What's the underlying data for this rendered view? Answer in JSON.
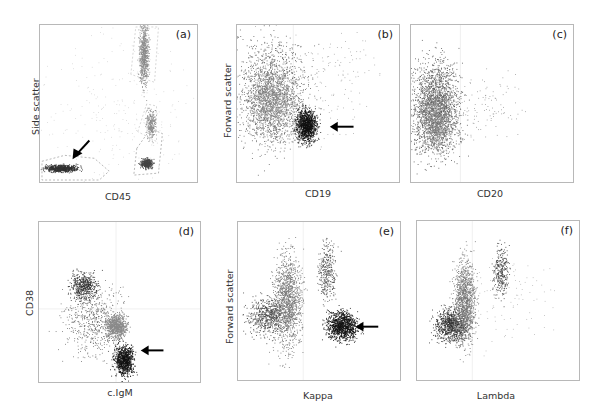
{
  "figure": {
    "panels": [
      {
        "id": "a",
        "label": "(a)",
        "xlabel": "CD45",
        "ylabel": "Side scatter",
        "arrow": "down-left, pointing at CD45-negative population (bottom-left gate)"
      },
      {
        "id": "b",
        "label": "(b)",
        "xlabel": "CD19",
        "ylabel": "Forward scatter",
        "arrow": "left, pointing at dark CD19+ population"
      },
      {
        "id": "c",
        "label": "(c)",
        "xlabel": "CD20",
        "ylabel": ""
      },
      {
        "id": "d",
        "label": "(d)",
        "xlabel": "c.IgM",
        "ylabel": "CD38",
        "arrow": "left, pointing at dark cytoplasmic IgM+ population"
      },
      {
        "id": "e",
        "label": "(e)",
        "xlabel": "Kappa",
        "ylabel": "Forward scatter",
        "arrow": "left, pointing at dark Kappa+ population"
      },
      {
        "id": "f",
        "label": "(f)",
        "xlabel": "Lambda",
        "ylabel": ""
      }
    ]
  },
  "chart_data": [
    {
      "type": "scatter",
      "panel": "a",
      "title": "(a)",
      "xlabel": "CD45",
      "ylabel": "Side scatter",
      "grid": false,
      "populations": [
        {
          "name": "CD45-negative (gated, arrow)",
          "center": [
            0.08,
            0.08
          ],
          "shade": "dark"
        },
        {
          "name": "granulocytes",
          "center": [
            0.6,
            0.75
          ],
          "shade": "gray"
        },
        {
          "name": "monocytes",
          "center": [
            0.7,
            0.33
          ],
          "shade": "gray"
        },
        {
          "name": "lymphocytes",
          "center": [
            0.65,
            0.12
          ],
          "shade": "dark-gray"
        }
      ]
    },
    {
      "type": "scatter",
      "panel": "b",
      "title": "(b)",
      "xlabel": "CD19",
      "ylabel": "Forward scatter",
      "grid": true,
      "populations": [
        {
          "name": "CD19-negative",
          "center": [
            0.22,
            0.45
          ],
          "shade": "gray"
        },
        {
          "name": "CD19-positive (arrow)",
          "center": [
            0.48,
            0.35
          ],
          "shade": "black"
        }
      ]
    },
    {
      "type": "scatter",
      "panel": "c",
      "title": "(c)",
      "xlabel": "CD20",
      "ylabel": "",
      "grid": true,
      "populations": [
        {
          "name": "CD20-negative",
          "center": [
            0.15,
            0.45
          ],
          "shade": "gray"
        }
      ]
    },
    {
      "type": "scatter",
      "panel": "d",
      "title": "(d)",
      "xlabel": "c.IgM",
      "ylabel": "CD38",
      "grid": true,
      "populations": [
        {
          "name": "CD38+ cIgM-",
          "center": [
            0.28,
            0.7
          ],
          "shade": "dark-gray"
        },
        {
          "name": "gray cluster",
          "center": [
            0.48,
            0.38
          ],
          "shade": "gray"
        },
        {
          "name": "cIgM+ (arrow)",
          "center": [
            0.55,
            0.18
          ],
          "shade": "black"
        }
      ]
    },
    {
      "type": "scatter",
      "panel": "e",
      "title": "(e)",
      "xlabel": "Kappa",
      "ylabel": "Forward scatter",
      "grid": true,
      "populations": [
        {
          "name": "Kappa-negative",
          "center": [
            0.28,
            0.4
          ],
          "shade": "gray"
        },
        {
          "name": "Kappa-positive (arrow)",
          "center": [
            0.62,
            0.35
          ],
          "shade": "black"
        }
      ]
    },
    {
      "type": "scatter",
      "panel": "f",
      "title": "(f)",
      "xlabel": "Lambda",
      "ylabel": "",
      "grid": true,
      "populations": [
        {
          "name": "Lambda-negative",
          "center": [
            0.25,
            0.35
          ],
          "shade": "gray"
        },
        {
          "name": "Lambda-dim",
          "center": [
            0.48,
            0.7
          ],
          "shade": "dark-gray"
        }
      ]
    }
  ]
}
